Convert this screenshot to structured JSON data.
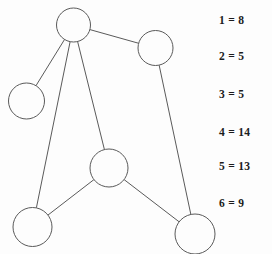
{
  "figure": {
    "type": "undirected-graph-diagram",
    "background_color": "#fdfdfd",
    "stroke_color": "#5a5a5a",
    "text_color": "#1c1c1c"
  },
  "graph": {
    "nodes": [
      {
        "id": "n1",
        "label": "",
        "cx": 73.5,
        "cy": 25,
        "r": 17
      },
      {
        "id": "n2",
        "label": "",
        "cx": 26.5,
        "cy": 101,
        "r": 18
      },
      {
        "id": "n3",
        "label": "",
        "cx": 155.5,
        "cy": 48,
        "r": 17.5
      },
      {
        "id": "n4",
        "label": "",
        "cx": 109,
        "cy": 168,
        "r": 19
      },
      {
        "id": "n5",
        "label": "",
        "cx": 32.5,
        "cy": 227,
        "r": 19.5
      },
      {
        "id": "n6",
        "label": "",
        "cx": 195,
        "cy": 234,
        "r": 20
      }
    ],
    "edges": [
      {
        "from": "n1",
        "to": "n2"
      },
      {
        "from": "n1",
        "to": "n3"
      },
      {
        "from": "n1",
        "to": "n4"
      },
      {
        "from": "n1",
        "to": "n5"
      },
      {
        "from": "n3",
        "to": "n6"
      },
      {
        "from": "n4",
        "to": "n5"
      },
      {
        "from": "n4",
        "to": "n6"
      }
    ]
  },
  "legend": {
    "rows": [
      {
        "key": "1",
        "separator": "=",
        "value": "8",
        "text": "1 = 8",
        "y": 14
      },
      {
        "key": "2",
        "separator": "=",
        "value": "5",
        "text": "2 = 5",
        "y": 50
      },
      {
        "key": "3",
        "separator": "=",
        "value": "5",
        "text": "3 = 5",
        "y": 88
      },
      {
        "key": "4",
        "separator": "=",
        "value": "14",
        "text": "4 = 14",
        "y": 126
      },
      {
        "key": "5",
        "separator": "=",
        "value": "13",
        "text": "5 = 13",
        "y": 160
      },
      {
        "key": "6",
        "separator": "=",
        "value": "9",
        "text": "6 = 9",
        "y": 197
      }
    ]
  }
}
